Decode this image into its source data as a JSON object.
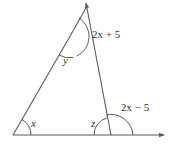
{
  "diagram": {
    "type": "triangle-with-exterior-angles",
    "colors": {
      "line": "#5a5a5a",
      "text": "#333333"
    },
    "labels": {
      "angle_bottom_left": "x",
      "angle_top": "y",
      "angle_bottom_right": "z",
      "exterior_top": "2x + 5",
      "exterior_bottom_right": "2x − 5"
    }
  }
}
